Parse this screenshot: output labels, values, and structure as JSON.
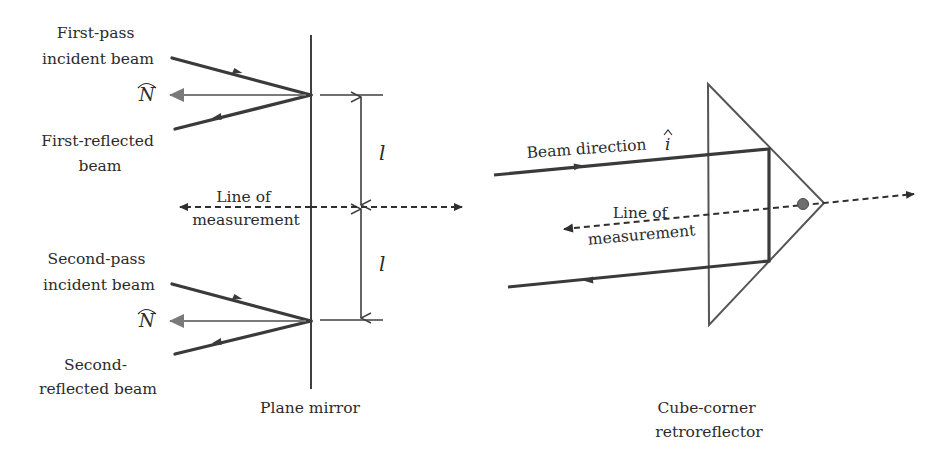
{
  "figure": {
    "left_panel": {
      "caption": "Plane mirror",
      "first_incident_label": [
        "First-pass",
        "incident beam"
      ],
      "first_reflected_label": [
        "First-reflected",
        "beam"
      ],
      "second_incident_label": [
        "Second-pass",
        "incident beam"
      ],
      "second_reflected_label": [
        "Second-",
        "reflected beam"
      ],
      "normal_symbol": "N",
      "normal_hat": "^",
      "measurement_label": [
        "Line of",
        "measurement"
      ],
      "distance_symbol_top": "l",
      "distance_symbol_bottom": "l"
    },
    "right_panel": {
      "caption": [
        "Cube-corner",
        "retroreflector"
      ],
      "beam_label": "Beam direction",
      "beam_symbol": "i",
      "beam_hat": "^",
      "measurement_label": [
        "Line of",
        "measurement"
      ]
    },
    "colors": {
      "beam": "#3a3a3a",
      "normal_arrow": "#7a7a7a",
      "apex_dot": "#6e6e6e"
    }
  }
}
